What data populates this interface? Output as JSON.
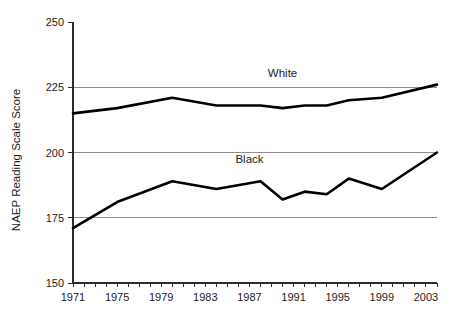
{
  "chart_data": {
    "type": "line",
    "title": "",
    "xlabel": "",
    "ylabel": "NAEP Reading Scale Score",
    "ylim": [
      150,
      250
    ],
    "yticks": [
      150,
      175,
      200,
      225,
      250
    ],
    "ytick_labels": [
      "150",
      "175",
      "200",
      "225",
      "250"
    ],
    "xlim": [
      1971,
      2004
    ],
    "xticks": [
      1971,
      1972,
      1973,
      1974,
      1975,
      1976,
      1977,
      1978,
      1979,
      1980,
      1981,
      1982,
      1983,
      1984,
      1985,
      1986,
      1987,
      1988,
      1989,
      1990,
      1991,
      1992,
      1993,
      1994,
      1995,
      1996,
      1997,
      1998,
      1999,
      2000,
      2001,
      2002,
      2003,
      2004
    ],
    "xtick_labels": [
      "1971",
      "1975",
      "1979",
      "1983",
      "1987",
      "1991",
      "1995",
      "1999",
      "2003"
    ],
    "xtick_label_years": [
      1971,
      1975,
      1979,
      1983,
      1987,
      1991,
      1995,
      1999,
      2003
    ],
    "grid": "horizontal",
    "gridlines": [
      175,
      200,
      225
    ],
    "legend": "inline-annotation",
    "series": [
      {
        "name": "White",
        "color": "#000000",
        "label_year": 1990,
        "label_value": 229,
        "x": [
          1971,
          1975,
          1980,
          1984,
          1988,
          1990,
          1992,
          1994,
          1996,
          1999,
          2004
        ],
        "values": [
          215,
          217,
          221,
          218,
          218,
          217,
          218,
          218,
          220,
          221,
          226
        ]
      },
      {
        "name": "Black",
        "color": "#000000",
        "label_year": 1987,
        "label_value": 196,
        "x": [
          1971,
          1975,
          1980,
          1984,
          1988,
          1990,
          1992,
          1994,
          1996,
          1999,
          2004
        ],
        "values": [
          171,
          181,
          189,
          186,
          189,
          182,
          185,
          184,
          190,
          186,
          200
        ]
      }
    ]
  }
}
